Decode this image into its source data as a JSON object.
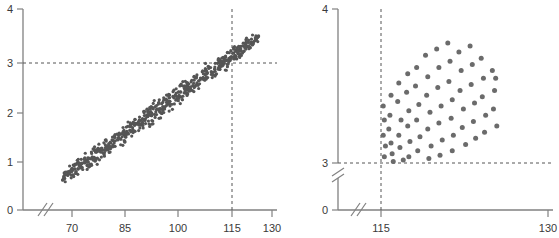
{
  "figure": {
    "background_color": "#ffffff",
    "axis_color": "#808080",
    "dash_color": "#555555",
    "dot_color_left": "#555555",
    "dot_color_right": "#6b6b6b",
    "label_color": "#3a3a3a"
  },
  "chart_data": [
    {
      "panel": "left",
      "type": "scatter",
      "title": "",
      "xlabel": "",
      "ylabel": "",
      "xlim": [
        63,
        130
      ],
      "ylim": [
        0,
        4
      ],
      "x_ticks": [
        70,
        85,
        100,
        115,
        130
      ],
      "x_tick_labels": [
        "70",
        "85",
        "100",
        "115",
        "130"
      ],
      "y_ticks": [
        0,
        1,
        2,
        3,
        4
      ],
      "y_tick_labels": [
        "0",
        "1",
        "2",
        "3",
        "4"
      ],
      "grid": false,
      "axis_break_x": true,
      "axis_break_y": false,
      "reference_lines": [
        {
          "orientation": "horizontal",
          "value": 3,
          "style": "dashed",
          "label": "3"
        },
        {
          "orientation": "vertical",
          "value": 115,
          "style": "dashed",
          "label": "115"
        }
      ],
      "marker_size_px": 1.6,
      "n_points": 620,
      "cloud": {
        "shape": "elongated-ellipse",
        "x_start": 67,
        "x_end": 126,
        "y_at_x_start": 0.62,
        "y_at_x_end": 3.45,
        "band_half_width": 0.3,
        "description": "dense positively-correlated elongated point cloud rising left-to-right"
      }
    },
    {
      "panel": "right",
      "type": "scatter",
      "title": "",
      "xlabel": "",
      "ylabel": "",
      "xlim": [
        112,
        130
      ],
      "ylim": [
        3,
        4
      ],
      "x_ticks": [
        115,
        130
      ],
      "x_tick_labels": [
        "115",
        "130"
      ],
      "y_ticks": [
        0,
        3,
        4
      ],
      "y_tick_labels": [
        "0",
        "3",
        "4"
      ],
      "grid": false,
      "axis_break_x": true,
      "axis_break_y": true,
      "reference_lines": [
        {
          "orientation": "horizontal",
          "value": 3,
          "style": "dashed",
          "label": "3"
        },
        {
          "orientation": "vertical",
          "value": 115,
          "style": "dashed",
          "label": "115"
        }
      ],
      "marker_size_px": 5,
      "n_points": 72,
      "points": [
        [
          115.2,
          3.37
        ],
        [
          115.3,
          3.28
        ],
        [
          115.2,
          3.18
        ],
        [
          115.4,
          3.11
        ],
        [
          115.3,
          3.04
        ],
        [
          115.9,
          3.44
        ],
        [
          115.8,
          3.31
        ],
        [
          115.7,
          3.22
        ],
        [
          115.9,
          3.13
        ],
        [
          116.0,
          3.06
        ],
        [
          116.1,
          3.01
        ],
        [
          116.6,
          3.52
        ],
        [
          116.5,
          3.4
        ],
        [
          116.8,
          3.28
        ],
        [
          116.6,
          3.18
        ],
        [
          116.7,
          3.1
        ],
        [
          117.0,
          3.02
        ],
        [
          117.4,
          3.58
        ],
        [
          117.3,
          3.46
        ],
        [
          117.5,
          3.34
        ],
        [
          117.4,
          3.24
        ],
        [
          117.6,
          3.14
        ],
        [
          117.5,
          3.04
        ],
        [
          118.2,
          3.62
        ],
        [
          118.1,
          3.5
        ],
        [
          118.4,
          3.38
        ],
        [
          118.2,
          3.28
        ],
        [
          118.5,
          3.17
        ],
        [
          118.3,
          3.08
        ],
        [
          119.0,
          3.7
        ],
        [
          119.2,
          3.56
        ],
        [
          119.1,
          3.44
        ],
        [
          119.4,
          3.33
        ],
        [
          119.2,
          3.22
        ],
        [
          119.5,
          3.11
        ],
        [
          119.3,
          3.03
        ],
        [
          120.0,
          3.74
        ],
        [
          120.2,
          3.62
        ],
        [
          120.1,
          3.49
        ],
        [
          120.4,
          3.37
        ],
        [
          120.2,
          3.26
        ],
        [
          120.5,
          3.15
        ],
        [
          120.3,
          3.05
        ],
        [
          121.0,
          3.78
        ],
        [
          121.2,
          3.66
        ],
        [
          121.1,
          3.53
        ],
        [
          121.4,
          3.41
        ],
        [
          121.3,
          3.29
        ],
        [
          121.5,
          3.18
        ],
        [
          121.4,
          3.08
        ],
        [
          122.0,
          3.72
        ],
        [
          122.2,
          3.6
        ],
        [
          122.1,
          3.47
        ],
        [
          122.4,
          3.35
        ],
        [
          122.3,
          3.23
        ],
        [
          122.6,
          3.12
        ],
        [
          123.0,
          3.76
        ],
        [
          123.2,
          3.64
        ],
        [
          123.1,
          3.51
        ],
        [
          123.4,
          3.39
        ],
        [
          123.3,
          3.27
        ],
        [
          123.5,
          3.16
        ],
        [
          124.0,
          3.68
        ],
        [
          124.2,
          3.55
        ],
        [
          124.1,
          3.43
        ],
        [
          124.4,
          3.31
        ],
        [
          124.3,
          3.2
        ],
        [
          125.0,
          3.6
        ],
        [
          125.2,
          3.47
        ],
        [
          125.1,
          3.35
        ],
        [
          125.4,
          3.24
        ],
        [
          125.3,
          3.55
        ]
      ]
    }
  ]
}
